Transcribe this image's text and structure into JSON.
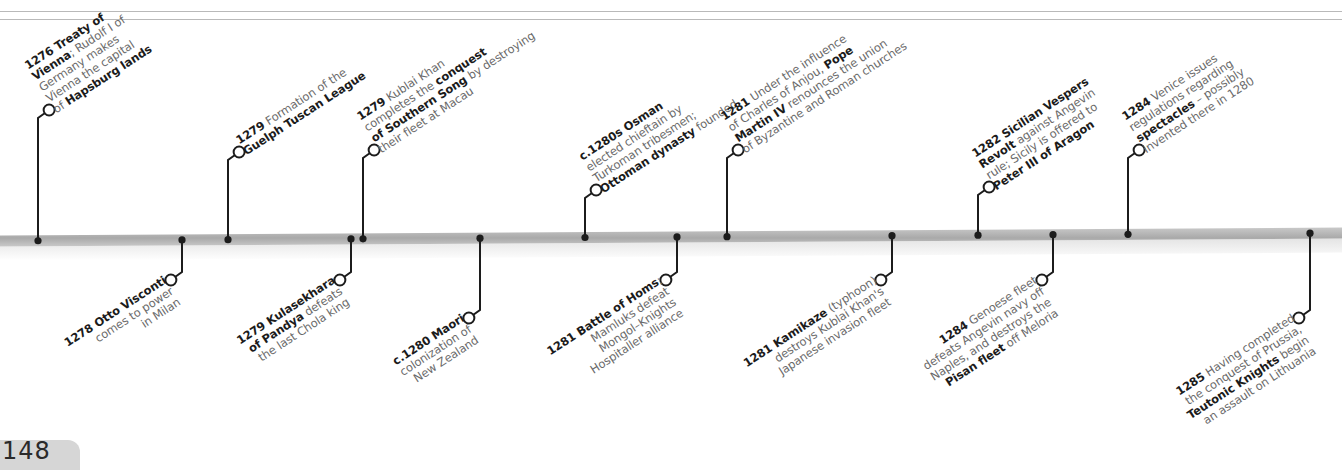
{
  "page": {
    "number": "148"
  },
  "colors": {
    "axis_top": "#c9c9c9",
    "axis_mid": "#a9a9a9",
    "axis_shadow": "#e4e4e4",
    "connector": "#1c1c1c",
    "bold_text": "#1b1b1b",
    "body_text": "#6a6a6a"
  },
  "axis": {
    "y_left": 241,
    "y_right": 233,
    "thickness": 11
  },
  "events": [
    {
      "id": "e1276",
      "x": 38,
      "side": "up",
      "stem_to": 118,
      "lines": [
        [
          {
            "b": "1276 Treaty of"
          }
        ],
        [
          {
            "b": "Vienna"
          },
          {
            "t": "; Rudolf I of"
          }
        ],
        [
          {
            "t": "Germany makes"
          }
        ],
        [
          {
            "t": "Vienna the capital"
          }
        ],
        [
          {
            "t": "of "
          },
          {
            "b": "Hapsburg lands"
          }
        ]
      ]
    },
    {
      "id": "e1278",
      "x": 182,
      "side": "down",
      "stem_to": 272,
      "lines": [
        [
          {
            "b": "1278 Otto Visconti"
          }
        ],
        [
          {
            "t": "comes to power"
          }
        ],
        [
          {
            "t": "in Milan"
          }
        ]
      ]
    },
    {
      "id": "e1279a",
      "x": 228,
      "side": "up",
      "stem_to": 160,
      "lines": [
        [
          {
            "b": "1279"
          },
          {
            "t": " Formation of the"
          }
        ],
        [
          {
            "b": "Guelph Tuscan League"
          }
        ]
      ]
    },
    {
      "id": "e1279b",
      "x": 351,
      "side": "down",
      "stem_to": 272,
      "lines": [
        [
          {
            "b": "1279 Kulasekhara"
          }
        ],
        [
          {
            "b": "of Pandya"
          },
          {
            "t": " defeats"
          }
        ],
        [
          {
            "t": "the last Chola king"
          }
        ]
      ]
    },
    {
      "id": "e1279c",
      "x": 363,
      "side": "up",
      "stem_to": 158,
      "lines": [
        [
          {
            "b": "1279"
          },
          {
            "t": " Kublai Khan"
          }
        ],
        [
          {
            "t": "completes the "
          },
          {
            "b": "conquest"
          }
        ],
        [
          {
            "b": "of Southern Song"
          },
          {
            "t": " by destroying"
          }
        ],
        [
          {
            "t": "their fleet at Macau"
          }
        ]
      ]
    },
    {
      "id": "e1280a",
      "x": 480,
      "side": "down",
      "stem_to": 310,
      "lines": [
        [
          {
            "b": "c.1280 Maori"
          }
        ],
        [
          {
            "t": "colonization of"
          }
        ],
        [
          {
            "t": "New Zealand"
          }
        ]
      ]
    },
    {
      "id": "e1280b",
      "x": 585,
      "side": "up",
      "stem_to": 198,
      "lines": [
        [
          {
            "b": "c.1280s Osman"
          }
        ],
        [
          {
            "t": "elected chieftain by"
          }
        ],
        [
          {
            "t": "Turkoman tribesmen;"
          }
        ],
        [
          {
            "b": "Ottoman dynasty"
          },
          {
            "t": " founded"
          }
        ]
      ]
    },
    {
      "id": "e1281a",
      "x": 677,
      "side": "down",
      "stem_to": 272,
      "lines": [
        [
          {
            "b": "1281 Battle of Homs"
          },
          {
            "t": ";"
          }
        ],
        [
          {
            "t": "Mamluks defeat"
          }
        ],
        [
          {
            "t": "Mongol–Knights"
          }
        ],
        [
          {
            "t": "Hospitaller alliance"
          }
        ]
      ]
    },
    {
      "id": "e1281b",
      "x": 727,
      "side": "up",
      "stem_to": 158,
      "lines": [
        [
          {
            "b": "1281"
          },
          {
            "t": " Under the influence"
          }
        ],
        [
          {
            "t": "of Charles of Anjou, "
          },
          {
            "b": "Pope"
          }
        ],
        [
          {
            "b": "Martin IV"
          },
          {
            "t": " renounces the union"
          }
        ],
        [
          {
            "t": "of Byzantine and Roman churches"
          }
        ]
      ]
    },
    {
      "id": "e1281c",
      "x": 892,
      "side": "down",
      "stem_to": 272,
      "lines": [
        [
          {
            "b": "1281 Kamikaze"
          },
          {
            "t": " (typhoon)"
          }
        ],
        [
          {
            "t": "destroys Kublai Khan's"
          }
        ],
        [
          {
            "t": "Japanese invasion fleet"
          }
        ]
      ]
    },
    {
      "id": "e1282",
      "x": 978,
      "side": "up",
      "stem_to": 195,
      "lines": [
        [
          {
            "b": "1282 Sicilian Vespers"
          }
        ],
        [
          {
            "b": "Revolt"
          },
          {
            "t": " against Angevin"
          }
        ],
        [
          {
            "t": "rule; Sicily is offered to"
          }
        ],
        [
          {
            "b": "Peter III of Aragon"
          }
        ]
      ]
    },
    {
      "id": "e1284a",
      "x": 1053,
      "side": "down",
      "stem_to": 272,
      "lines": [
        [
          {
            "b": "1284"
          },
          {
            "t": " Genoese fleet"
          }
        ],
        [
          {
            "t": "defeats Angevin navy off"
          }
        ],
        [
          {
            "t": "Naples, and destroys the"
          }
        ],
        [
          {
            "b": "Pisan fleet"
          },
          {
            "t": " off Meloria"
          }
        ]
      ]
    },
    {
      "id": "e1284b",
      "x": 1128,
      "side": "up",
      "stem_to": 158,
      "lines": [
        [
          {
            "b": "1284"
          },
          {
            "t": " Venice issues"
          }
        ],
        [
          {
            "t": "regulations regarding"
          }
        ],
        [
          {
            "b": "spectacles"
          },
          {
            "t": " – possibly"
          }
        ],
        [
          {
            "t": "invented there in 1280"
          }
        ]
      ]
    },
    {
      "id": "e1285",
      "x": 1310,
      "side": "down",
      "stem_to": 310,
      "lines": [
        [
          {
            "b": "1285"
          },
          {
            "t": " Having completed"
          }
        ],
        [
          {
            "t": "the conquest of Prussia,"
          }
        ],
        [
          {
            "b": "Teutonic Knights"
          },
          {
            "t": " begin"
          }
        ],
        [
          {
            "t": "an assault on Lithuania"
          }
        ]
      ]
    }
  ]
}
